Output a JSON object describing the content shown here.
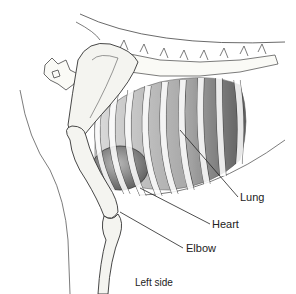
{
  "figure": {
    "labels": [
      {
        "id": "lung",
        "text": "Lung"
      },
      {
        "id": "heart",
        "text": "Heart"
      },
      {
        "id": "elbow",
        "text": "Elbow"
      }
    ],
    "caption": "Left side"
  },
  "colors": {
    "line": "#333333",
    "lung_shade": "#9a9a9a",
    "heart_shade": "#6e6e6e",
    "bone_fill": "#f4f4f0"
  }
}
